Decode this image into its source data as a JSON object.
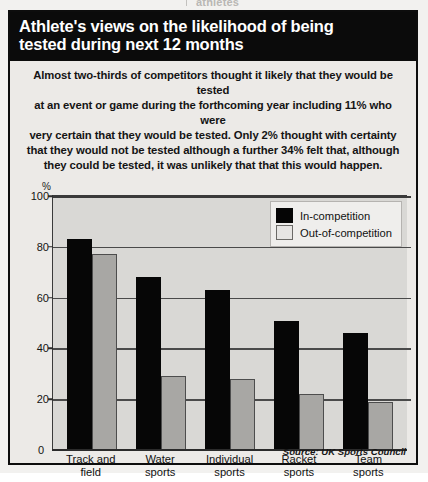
{
  "bleed": {
    "clipped_text": "athletes"
  },
  "header": {
    "title_line1": "Athlete's views on the likelihood of being",
    "title_line2": "tested during next 12 months"
  },
  "intro": {
    "line1": "Almost two-thirds of competitors thought it likely that they would be tested",
    "line2": "at an event or game during the forthcoming year including 11% who were",
    "line3": "very certain that they would be tested. Only 2% thought with certainty",
    "line4": "that they would not be tested although a further 34% felt that, although",
    "line5": "they could be tested, it was unlikely that that this would happen."
  },
  "legend": {
    "items": [
      {
        "label": "In-competition",
        "color": "#050505"
      },
      {
        "label": "Out-of-competition",
        "color": "#e6e5e3"
      }
    ]
  },
  "axis": {
    "y_unit": "%",
    "ticks": [
      "100",
      "80",
      "60",
      "40",
      "20",
      "0"
    ],
    "zero_label": "0"
  },
  "footer": {
    "source": "Source: UK Sports Council"
  },
  "chart_data": {
    "type": "bar",
    "title": "Athlete's views on the likelihood of being tested during next 12 months",
    "categories": [
      "Track and field",
      "Water sports",
      "Individual sports",
      "Racket sports",
      "Team sports"
    ],
    "category_lines": [
      [
        "Track and",
        "field"
      ],
      [
        "Water",
        "sports"
      ],
      [
        "Individual",
        "sports"
      ],
      [
        "Racket",
        "sports"
      ],
      [
        "Team",
        "sports"
      ]
    ],
    "series": [
      {
        "name": "In-competition",
        "color": "#050505",
        "values": [
          83,
          68,
          63,
          51,
          46
        ]
      },
      {
        "name": "Out-of-competition",
        "color": "#a8a7a4",
        "values": [
          77,
          29,
          28,
          22,
          19
        ]
      }
    ],
    "xlabel": "",
    "ylabel": "%",
    "ylim": [
      0,
      100
    ],
    "yticks": [
      0,
      20,
      40,
      60,
      80,
      100
    ],
    "grid": true,
    "legend_position": "top-right",
    "source": "Source: UK Sports Council"
  }
}
